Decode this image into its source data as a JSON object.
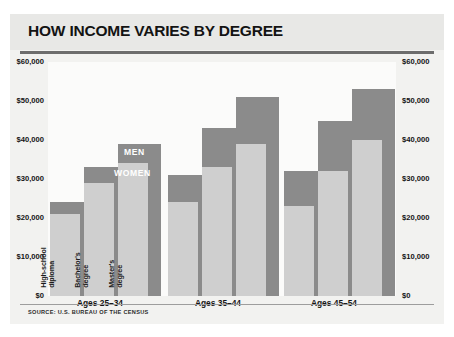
{
  "chart_title": "HOW INCOME VARIES BY DEGREE",
  "source_note": "SOURCE: U.S. BUREAU OF THE CENSUS",
  "series_tags": {
    "men": "MEN",
    "women": "WOMEN"
  },
  "axis": {
    "ticks": [
      "$60,000",
      "$50,000",
      "$40,000",
      "$30,000",
      "$20,000",
      "$10,000",
      "$0"
    ]
  },
  "colors": {
    "men_bar": "#8b8b8b",
    "women_bar": "#cfcfcf",
    "card_background": "#f2f2f0",
    "plot_background": "#fbfbfa",
    "title_band": "#e8e8e6",
    "rule": "#6d6d6d",
    "text": "#141414"
  },
  "chart_data": {
    "type": "bar",
    "title": "HOW INCOME VARIES BY DEGREE",
    "xlabel": "",
    "ylabel": "",
    "ylim": [
      0,
      60000
    ],
    "ytick_values": [
      0,
      10000,
      20000,
      30000,
      40000,
      50000,
      60000
    ],
    "ytick_labels": [
      "$0",
      "$10,000",
      "$20,000",
      "$30,000",
      "$40,000",
      "$50,000",
      "$60,000"
    ],
    "grid": false,
    "legend_position": "inline-overlay",
    "dual_axis": true,
    "groups": [
      "Ages 25–34",
      "Ages 35–44",
      "Ages 45–54"
    ],
    "categories": [
      "High-school diploma",
      "Bachelor's degree",
      "Master's degree"
    ],
    "series": [
      {
        "name": "MEN",
        "values": [
          [
            24000,
            33000,
            39000
          ],
          [
            31000,
            43000,
            51000
          ],
          [
            32000,
            45000,
            53000
          ]
        ]
      },
      {
        "name": "WOMEN",
        "values": [
          [
            21000,
            29000,
            34000
          ],
          [
            24000,
            33000,
            39000
          ],
          [
            23000,
            32000,
            40000
          ]
        ]
      }
    ]
  }
}
